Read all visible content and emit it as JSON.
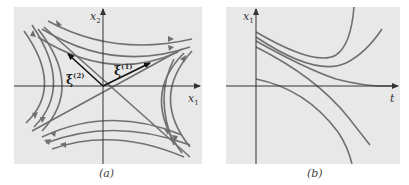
{
  "figure": {
    "panels": [
      {
        "id": "a",
        "caption": "(a)",
        "x_axis_label": "x",
        "x_axis_sub": "1",
        "y_axis_label": "x",
        "y_axis_sub": "2",
        "eigenvectors": [
          {
            "label": "ξ",
            "sup": "(1)"
          },
          {
            "label": "ξ",
            "sup": "(2)"
          }
        ]
      },
      {
        "id": "b",
        "caption": "(b)",
        "x_axis_label": "t",
        "y_axis_label": "x",
        "y_axis_sub": "1"
      }
    ],
    "colors": {
      "panel_bg": "#e8e8e8",
      "curve": "#707070",
      "axis": "#333333",
      "vector": "#111111"
    }
  }
}
